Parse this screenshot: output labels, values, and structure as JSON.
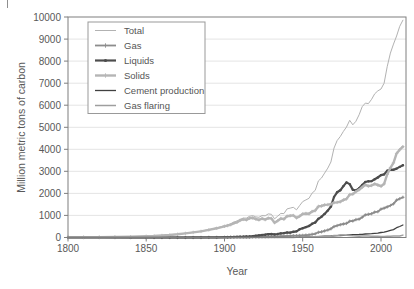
{
  "figure": {
    "background": "#ffffff",
    "plot_border_color": "#7f7f7f",
    "gridline_color": "#e1e1e1",
    "tick_label_color": "#595959",
    "axis_label_color": "#595959"
  },
  "legend": {
    "position": "top-left",
    "border_color": "#999999",
    "text_color": "#555555"
  },
  "chart_data": {
    "type": "line",
    "title": "",
    "xlabel": "Year",
    "ylabel": "Million metric tons of carbon",
    "xlim": [
      1800,
      2016
    ],
    "ylim": [
      0,
      10000
    ],
    "xticks": [
      1800,
      1850,
      1900,
      1950,
      2000
    ],
    "yticks": [
      0,
      1000,
      2000,
      3000,
      4000,
      5000,
      6000,
      7000,
      8000,
      9000,
      10000
    ],
    "grid": "horizontal",
    "legend_position": "top-left",
    "x": [
      1800,
      1810,
      1820,
      1830,
      1840,
      1850,
      1855,
      1860,
      1865,
      1870,
      1875,
      1880,
      1885,
      1890,
      1895,
      1900,
      1902,
      1904,
      1906,
      1908,
      1910,
      1912,
      1914,
      1916,
      1918,
      1920,
      1922,
      1924,
      1926,
      1928,
      1930,
      1932,
      1934,
      1936,
      1938,
      1940,
      1942,
      1944,
      1946,
      1948,
      1950,
      1952,
      1954,
      1956,
      1958,
      1960,
      1962,
      1964,
      1966,
      1968,
      1970,
      1972,
      1974,
      1976,
      1978,
      1980,
      1982,
      1984,
      1986,
      1988,
      1990,
      1992,
      1994,
      1996,
      1998,
      2000,
      2002,
      2004,
      2006,
      2008,
      2010,
      2012,
      2014
    ],
    "series": [
      {
        "name": "Total",
        "color": "#b2b2b2",
        "line_width": 1,
        "marker": "none",
        "values": [
          8,
          10,
          14,
          24,
          34,
          54,
          69,
          91,
          117,
          147,
          188,
          236,
          288,
          356,
          437,
          534,
          574,
          620,
          699,
          747,
          819,
          881,
          880,
          963,
          994,
          932,
          916,
          995,
          984,
          1072,
          1053,
          847,
          968,
          1095,
          1084,
          1299,
          1333,
          1371,
          1254,
          1448,
          1630,
          1706,
          1777,
          2012,
          2135,
          2569,
          2700,
          2919,
          3148,
          3424,
          4053,
          4395,
          4581,
          4813,
          5012,
          5315,
          5113,
          5269,
          5566,
          5930,
          6096,
          6074,
          6266,
          6518,
          6649,
          6735,
          6998,
          7745,
          8363,
          8773,
          9140,
          9575,
          9855
        ]
      },
      {
        "name": "Gas",
        "color": "#8c8c8c",
        "line_width": 1.8,
        "marker": "plus",
        "values": [
          0,
          0,
          0,
          0,
          0,
          0,
          0,
          0,
          0,
          0,
          0,
          0,
          2,
          3,
          6,
          10,
          10,
          11,
          12,
          13,
          14,
          16,
          17,
          19,
          21,
          23,
          24,
          30,
          34,
          40,
          52,
          45,
          50,
          60,
          62,
          74,
          77,
          85,
          80,
          90,
          97,
          110,
          123,
          146,
          167,
          235,
          260,
          298,
          340,
          395,
          493,
          540,
          580,
          610,
          640,
          740,
          750,
          810,
          830,
          920,
          1026,
          1050,
          1080,
          1150,
          1170,
          1288,
          1330,
          1390,
          1450,
          1530,
          1698,
          1760,
          1823
        ]
      },
      {
        "name": "Liquids",
        "color": "#4d4d4d",
        "line_width": 2.2,
        "marker": "circle",
        "values": [
          0,
          0,
          0,
          0,
          0,
          0,
          0,
          0,
          0,
          1,
          2,
          3,
          5,
          8,
          11,
          16,
          18,
          21,
          24,
          28,
          32,
          38,
          44,
          52,
          60,
          78,
          94,
          113,
          128,
          151,
          160,
          140,
          160,
          185,
          200,
          228,
          220,
          260,
          280,
          370,
          423,
          470,
          520,
          620,
          680,
          849,
          940,
          1070,
          1220,
          1400,
          1838,
          2050,
          2140,
          2330,
          2500,
          2422,
          2170,
          2130,
          2230,
          2380,
          2517,
          2550,
          2560,
          2640,
          2720,
          2831,
          2860,
          3030,
          3080,
          3070,
          3123,
          3200,
          3280
        ]
      },
      {
        "name": "Solids",
        "color": "#b5b5b5",
        "line_width": 2.4,
        "marker": "plus",
        "values": [
          8,
          10,
          14,
          24,
          34,
          54,
          68,
          90,
          114,
          146,
          184,
          232,
          278,
          345,
          416,
          508,
          540,
          580,
          650,
          690,
          774,
          820,
          800,
          870,
          890,
          839,
          800,
          860,
          810,
          880,
          862,
          670,
          760,
          860,
          830,
          964,
          990,
          1000,
          890,
          960,
          1070,
          1090,
          1080,
          1180,
          1220,
          1410,
          1430,
          1480,
          1490,
          1510,
          1584,
          1590,
          1620,
          1700,
          1750,
          1947,
          1970,
          2080,
          2170,
          2280,
          2393,
          2330,
          2360,
          2430,
          2380,
          2327,
          2430,
          2860,
          3160,
          3390,
          3812,
          3980,
          4117
        ]
      },
      {
        "name": "Cement production",
        "color": "#404040",
        "line_width": 1.3,
        "marker": "none",
        "values": [
          0,
          0,
          0,
          0,
          0,
          0,
          0,
          0,
          0,
          0,
          0,
          0,
          0,
          0,
          0,
          1,
          1,
          1,
          1,
          2,
          2,
          2,
          2,
          2,
          3,
          3,
          3,
          4,
          4,
          5,
          6,
          5,
          5,
          6,
          7,
          11,
          11,
          10,
          10,
          14,
          18,
          22,
          26,
          32,
          36,
          43,
          49,
          57,
          63,
          70,
          78,
          84,
          90,
          96,
          104,
          120,
          125,
          132,
          137,
          145,
          157,
          162,
          173,
          185,
          195,
          226,
          240,
          280,
          320,
          358,
          446,
          500,
          568
        ]
      },
      {
        "name": "Gas flaring",
        "color": "#9e9e9e",
        "line_width": 1.5,
        "marker": "none",
        "values": [
          0,
          0,
          0,
          0,
          0,
          0,
          0,
          0,
          0,
          0,
          0,
          0,
          0,
          0,
          0,
          0,
          0,
          0,
          0,
          0,
          0,
          0,
          0,
          0,
          0,
          0,
          0,
          0,
          0,
          0,
          1,
          1,
          2,
          2,
          3,
          5,
          5,
          6,
          8,
          15,
          23,
          26,
          28,
          31,
          34,
          39,
          42,
          46,
          52,
          56,
          87,
          95,
          110,
          108,
          104,
          89,
          75,
          67,
          60,
          62,
          64,
          62,
          60,
          59,
          54,
          46,
          50,
          55,
          60,
          64,
          66,
          70,
          110
        ]
      }
    ]
  }
}
